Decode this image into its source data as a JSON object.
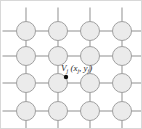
{
  "figure": {
    "name": "lattice-mesh-diagram",
    "type": "diagram",
    "background_color": "#ffffff",
    "border_color": "#d8d8d8",
    "width": 142,
    "height": 129
  },
  "lattice": {
    "rows": 4,
    "columns": 4,
    "node_radius": 9.5,
    "node_fill_color": "#ebebeb",
    "node_stroke_color": "#a0a0a0",
    "edge_color": "#9a9a9a",
    "stub_color": "#9a9a9a",
    "column_x": [
      25,
      57,
      89,
      121
    ],
    "row_y": [
      30,
      55,
      82,
      110
    ],
    "stub_length": 14
  },
  "marker": {
    "name": "field-point-marker",
    "shape": "filled-circle",
    "color": "#111111",
    "radius": 2.2,
    "x": 65,
    "y": 76
  },
  "label": {
    "vertex_symbol": "V",
    "vertex_subscript": "j",
    "open_paren": " (",
    "coord_x_symbol": "x",
    "coord_x_subscript": "j",
    "comma": ", ",
    "coord_y_symbol": "y",
    "coord_y_subscript": "j",
    "close_paren": ")",
    "full_text": "Vj (xj, yj)",
    "color": "#2b2b2b"
  }
}
